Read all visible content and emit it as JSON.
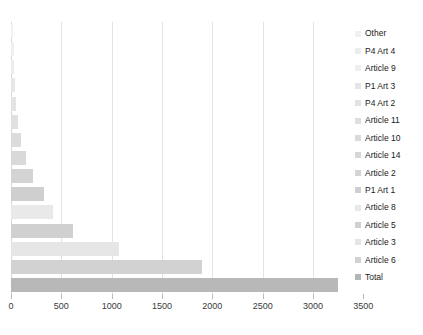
{
  "chart_data": {
    "type": "bar",
    "orientation": "horizontal",
    "title": "",
    "xlabel": "",
    "ylabel": "",
    "xlim": [
      0,
      3500
    ],
    "xticks": [
      0,
      500,
      1000,
      1500,
      2000,
      2500,
      3000,
      3500
    ],
    "xticklabels": [
      "0",
      "500",
      "1000",
      "1500",
      "2000",
      "2500",
      "3000",
      "3500"
    ],
    "grid": true,
    "legend_position": "right",
    "categories": [
      "Other",
      "P4 Art 4",
      "Article 9",
      "P1 Art 3",
      "P4 Art 2",
      "Article 11",
      "Article 10",
      "Article 14",
      "Article 2",
      "P1 Art 1",
      "Article 8",
      "Article 5",
      "Article 3",
      "Article 6",
      "Total"
    ],
    "values": [
      20,
      25,
      30,
      40,
      45,
      70,
      100,
      150,
      220,
      330,
      420,
      620,
      1070,
      1900,
      3250
    ],
    "series": [
      {
        "name": "Counts",
        "points": [
          {
            "label": "Other",
            "value": 20,
            "color": "#f2f2f2"
          },
          {
            "label": "P4 Art 4",
            "value": 25,
            "color": "#efefef"
          },
          {
            "label": "Article 9",
            "value": 30,
            "color": "#ececec"
          },
          {
            "label": "P1 Art 3",
            "value": 40,
            "color": "#e7e7e7"
          },
          {
            "label": "P4 Art 2",
            "value": 45,
            "color": "#e4e4e4"
          },
          {
            "label": "Article 11",
            "value": 70,
            "color": "#e0e0e0"
          },
          {
            "label": "Article 10",
            "value": 100,
            "color": "#dcdcdc"
          },
          {
            "label": "Article 14",
            "value": 150,
            "color": "#d9d9d9"
          },
          {
            "label": "Article 2",
            "value": 220,
            "color": "#d4d4d4"
          },
          {
            "label": "P1 Art 1",
            "value": 330,
            "color": "#cfcfcf"
          },
          {
            "label": "Article 8",
            "value": 420,
            "color": "#e9e9e9"
          },
          {
            "label": "Article 5",
            "value": 620,
            "color": "#d0d0d0"
          },
          {
            "label": "Article 3",
            "value": 1070,
            "color": "#e6e6e6"
          },
          {
            "label": "Article 6",
            "value": 1900,
            "color": "#d2d2d2"
          },
          {
            "label": "Total",
            "value": 3250,
            "color": "#b8b8b8"
          }
        ]
      }
    ]
  },
  "legend": {
    "items": [
      {
        "label": "Other",
        "color": "#f0f0f0"
      },
      {
        "label": "P4 Art 4",
        "color": "#ececec"
      },
      {
        "label": "Article 9",
        "color": "#eeeeee"
      },
      {
        "label": "P1 Art 3",
        "color": "#e6e6e6"
      },
      {
        "label": "P4 Art 2",
        "color": "#e2e2e2"
      },
      {
        "label": "Article 11",
        "color": "#dedede"
      },
      {
        "label": "Article 10",
        "color": "#dadada"
      },
      {
        "label": "Article 14",
        "color": "#d7d7d7"
      },
      {
        "label": "Article 2",
        "color": "#d4d4d4"
      },
      {
        "label": "P1 Art 1",
        "color": "#cfcfcf"
      },
      {
        "label": "Article 8",
        "color": "#e9e9e9"
      },
      {
        "label": "Article 5",
        "color": "#d0d0d0"
      },
      {
        "label": "Article 3",
        "color": "#e4e4e4"
      },
      {
        "label": "Article 6",
        "color": "#d2d2d2"
      },
      {
        "label": "Total",
        "color": "#b5b5b5"
      }
    ]
  }
}
